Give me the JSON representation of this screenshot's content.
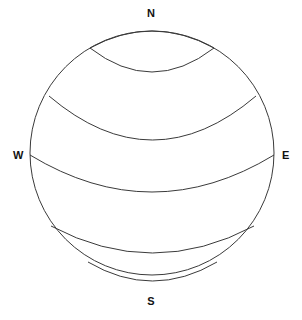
{
  "figure": {
    "background_color": "#ffffff",
    "stroke_color": "#3a3a3a",
    "label_color": "#111111",
    "width": 302,
    "height": 320
  },
  "labels": {
    "north": "N",
    "south": "S",
    "west": "W",
    "east": "E"
  },
  "watermark": {
    "text": ""
  },
  "chart_data": {
    "type": "line",
    "xlabel": "",
    "ylabel": "",
    "grid": false,
    "legend_position": "none",
    "sphere": {
      "center_x": 152,
      "center_y": 153,
      "radius": 122,
      "stroke_color": "#3a3a3a",
      "stroke_width": 1
    },
    "compass_points": [
      {
        "name": "N",
        "x": 152,
        "y": 14
      },
      {
        "name": "W",
        "x": 18,
        "y": 155
      },
      {
        "name": "E",
        "x": 287,
        "y": 155
      },
      {
        "name": "S",
        "x": 152,
        "y": 302
      }
    ],
    "latitude_arcs": [
      {
        "name": "small-polar-circle",
        "center_y_at_axis": 72,
        "half_width": 62,
        "curvature": 17
      },
      {
        "name": "upper-mid-latitude",
        "center_y_at_axis": 140,
        "half_width": 110,
        "curvature": 36
      },
      {
        "name": "equator",
        "center_y_at_axis": 192,
        "half_width": 122,
        "curvature": 40
      },
      {
        "name": "lower-mid-latitude",
        "center_y_at_axis": 253,
        "half_width": 104,
        "curvature": 34
      },
      {
        "name": "south-polar-circle",
        "center_y_at_axis": 281,
        "half_width": 70,
        "curvature": 20
      }
    ],
    "arc_endpoints": [
      {
        "arc": "small-polar-circle",
        "left": [
          90,
          48
        ],
        "right": [
          214,
          48
        ]
      },
      {
        "arc": "upper-mid-latitude",
        "left": [
          49,
          96
        ],
        "right": [
          256,
          96
        ]
      },
      {
        "arc": "equator",
        "left": [
          30,
          155
        ],
        "right": [
          274,
          155
        ]
      },
      {
        "arc": "lower-mid-latitude",
        "left": [
          51,
          226
        ],
        "right": [
          254,
          226
        ]
      },
      {
        "arc": "south-polar-circle",
        "left": [
          88,
          262
        ],
        "right": [
          217,
          262
        ]
      }
    ]
  }
}
